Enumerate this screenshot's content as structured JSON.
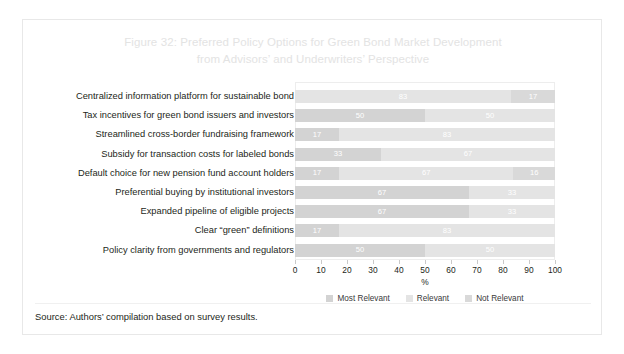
{
  "figure": {
    "title_line1": "Figure 32: Preferred Policy Options for Green Bond Market Development",
    "title_line2": "from Advisors’ and Underwriters’ Perspective",
    "source": "Source: Authors’ compilation based on survey results."
  },
  "chart_data": {
    "type": "bar",
    "orientation": "horizontal",
    "stacked": true,
    "stack_mode": "percent",
    "title": "Figure 32: Preferred Policy Options for Green Bond Market Development from Advisors’ and Underwriters’ Perspective",
    "xlabel": "%",
    "ylabel": "",
    "xlim": [
      0,
      100
    ],
    "xticks": [
      0,
      10,
      20,
      30,
      40,
      50,
      60,
      70,
      80,
      90,
      100
    ],
    "xtick_labels": [
      "0",
      "10",
      "20",
      "30",
      "40",
      "50",
      "60",
      "70",
      "80",
      "90",
      "100"
    ],
    "grid": false,
    "legend_position": "bottom",
    "categories": [
      "Centralized information platform for sustainable bond",
      "Tax incentives for green bond issuers and investors",
      "Streamlined cross-border fundraising framework",
      "Subsidy for transaction costs for labeled bonds",
      "Default choice for new pension fund account holders",
      "Preferential buying by institutional investors",
      "Expanded pipeline of eligible projects",
      "Clear “green” definitions",
      "Policy clarity from governments and regulators"
    ],
    "series": [
      {
        "name": "Most Relevant",
        "color": "#d3d3d3",
        "values": [
          0,
          50,
          17,
          33,
          17,
          67,
          67,
          17,
          50
        ],
        "labels": [
          "",
          "50",
          "17",
          "33",
          "17",
          "67",
          "67",
          "17",
          "50"
        ]
      },
      {
        "name": "Relevant",
        "color": "#e4e4e4",
        "values": [
          83,
          50,
          83,
          67,
          67,
          33,
          33,
          83,
          50
        ],
        "labels": [
          "83",
          "50",
          "83",
          "67",
          "67",
          "33",
          "33",
          "83",
          "50"
        ]
      },
      {
        "name": "Not Relevant",
        "color": "#d9d9d9",
        "values": [
          17,
          0,
          0,
          0,
          16,
          0,
          0,
          0,
          0
        ],
        "labels": [
          "17",
          "",
          "",
          "",
          "16",
          "",
          "",
          "",
          ""
        ]
      }
    ]
  }
}
